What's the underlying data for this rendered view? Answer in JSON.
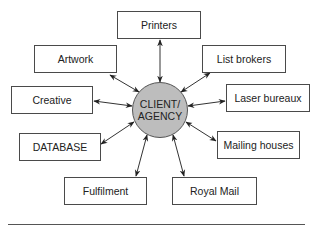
{
  "diagram": {
    "hub": {
      "line1": "CLIENT/",
      "line2": "AGENCY",
      "fill_color": "#bdbdbd",
      "center": [
        160,
        110
      ],
      "radius": 28
    },
    "nodes": [
      {
        "id": "printers",
        "label": "Printers",
        "x": 117,
        "y": 11,
        "w": 84,
        "h": 28
      },
      {
        "id": "artwork",
        "label": "Artwork",
        "x": 34,
        "y": 45,
        "w": 83,
        "h": 28
      },
      {
        "id": "list-brokers",
        "label": "List brokers",
        "x": 202,
        "y": 45,
        "w": 84,
        "h": 28
      },
      {
        "id": "creative",
        "label": "Creative",
        "x": 11,
        "y": 86,
        "w": 82,
        "h": 28
      },
      {
        "id": "laser-bureaux",
        "label": "Laser bureaux",
        "x": 226,
        "y": 84,
        "w": 84,
        "h": 28
      },
      {
        "id": "database",
        "label": "DATABASE",
        "x": 19,
        "y": 133,
        "w": 82,
        "h": 28
      },
      {
        "id": "mailing-houses",
        "label": "Mailing houses",
        "x": 217,
        "y": 131,
        "w": 83,
        "h": 28
      },
      {
        "id": "fulfilment",
        "label": "Fulfilment",
        "x": 64,
        "y": 177,
        "w": 83,
        "h": 28
      },
      {
        "id": "royal-mail",
        "label": "Royal Mail",
        "x": 172,
        "y": 177,
        "w": 85,
        "h": 28
      }
    ],
    "edges": [
      {
        "from": "hub",
        "to": "printers",
        "direction": "bidirectional",
        "line": [
          160,
          82,
          160,
          40
        ]
      },
      {
        "from": "hub",
        "to": "artwork",
        "direction": "bidirectional",
        "line": [
          139,
          92,
          110,
          75
        ]
      },
      {
        "from": "hub",
        "to": "list-brokers",
        "direction": "bidirectional",
        "line": [
          181,
          92,
          210,
          73
        ]
      },
      {
        "from": "hub",
        "to": "creative",
        "direction": "bidirectional",
        "line": [
          132,
          106,
          94,
          101
        ]
      },
      {
        "from": "hub",
        "to": "laser-bureaux",
        "direction": "bidirectional",
        "line": [
          188,
          106,
          225,
          101
        ]
      },
      {
        "from": "hub",
        "to": "database",
        "direction": "bidirectional",
        "line": [
          134,
          122,
          101,
          144
        ]
      },
      {
        "from": "hub",
        "to": "mailing-houses",
        "direction": "bidirectional",
        "line": [
          186,
          122,
          216,
          141
        ]
      },
      {
        "from": "hub",
        "to": "fulfilment",
        "direction": "bidirectional",
        "line": [
          147,
          135,
          136,
          176
        ]
      },
      {
        "from": "hub",
        "to": "royal-mail",
        "direction": "bidirectional",
        "line": [
          173,
          135,
          184,
          176
        ]
      }
    ],
    "colors": {
      "stroke": "#333333",
      "box_border": "#4a4a4a",
      "text": "#222222"
    }
  }
}
